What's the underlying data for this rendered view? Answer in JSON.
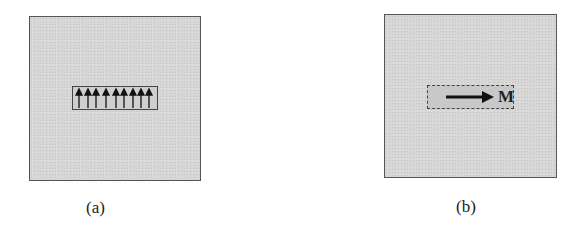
{
  "figure": {
    "panels": [
      {
        "id": "a",
        "caption": "(a)",
        "description": "Square gray region containing a rectangle with an array of upward-pointing arrows",
        "arrow_count": 9,
        "arrow_direction": "up",
        "inner_border": "solid"
      },
      {
        "id": "b",
        "caption": "(b)",
        "description": "Square gray region containing a dashed rectangle with a single rightward arrow labeled M",
        "arrow_count": 1,
        "arrow_direction": "right",
        "arrow_label": "M",
        "inner_border": "dashed"
      }
    ],
    "colors": {
      "panel_fill": "#d6d6d6",
      "border": "#555555",
      "arrow": "#111111"
    }
  }
}
